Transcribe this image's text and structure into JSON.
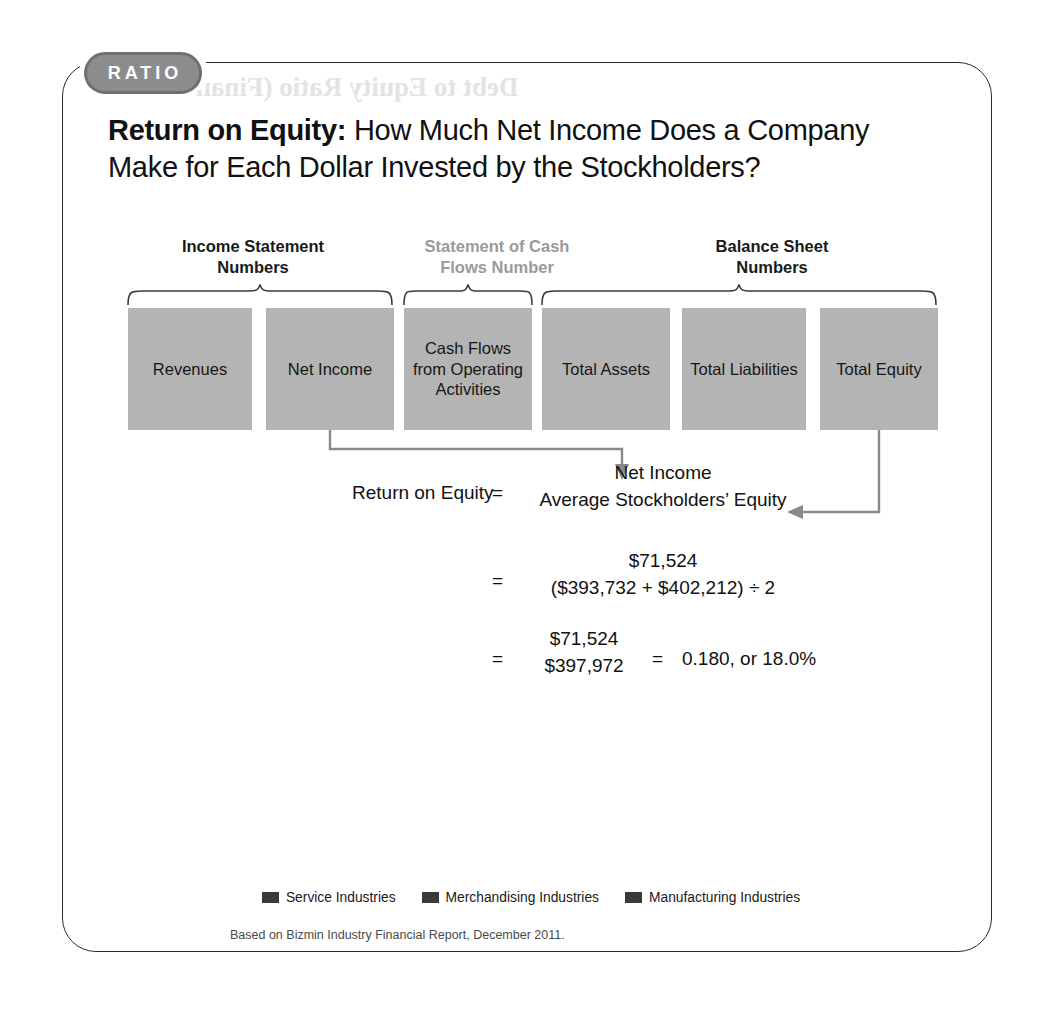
{
  "badge": {
    "label": "RATIO"
  },
  "title": {
    "bold": "Return on Equity:",
    "rest": " How Much Net Income Does a Company Make for Each Dollar Invested by the Stockholders?"
  },
  "groups": [
    {
      "label": "Income Statement\nNumbers",
      "muted": false
    },
    {
      "label": "Statement of Cash\nFlows Number",
      "muted": true
    },
    {
      "label": "Balance Sheet\nNumbers",
      "muted": false
    }
  ],
  "boxes": [
    {
      "label": "Revenues"
    },
    {
      "label": "Net Income"
    },
    {
      "label": "Cash Flows from Operating Activities"
    },
    {
      "label": "Total Assets"
    },
    {
      "label": "Total Liabilities"
    },
    {
      "label": "Total Equity"
    }
  ],
  "formula": {
    "name": "Return on Equity",
    "equals1": "=",
    "numerator1": "Net Income",
    "denominator1": "Average Stockholders’ Equity",
    "equals2": "=",
    "numerator2": "$71,524",
    "denominator2": "($393,732 + $402,212) ÷ 2",
    "equals3": "=",
    "numerator3": "$71,524",
    "denominator3": "$397,972",
    "equals4": "=",
    "result": "0.180, or 18.0%"
  },
  "chart_data": {
    "type": "bar",
    "orientation": "horizontal",
    "categories": [
      "Advertising Agencies",
      "Scheduled Air Transportation",
      "Clothing Stores",
      "Grocery Stores",
      "Industrial Machinery Manufacturing",
      "Computer and Peripheral Equipment Manufacturing"
    ],
    "values": [
      10.0,
      8.6,
      14.4,
      10.0,
      8.6,
      9.2
    ],
    "value_labels": [
      "10.0",
      "8.6",
      "14.4",
      "10.0",
      "8.6",
      "9.2"
    ],
    "group_of": [
      "Service Industries",
      "Service Industries",
      "Merchandising Industries",
      "Merchandising Industries",
      "Manufacturing Industries",
      "Manufacturing Industries"
    ],
    "ticks": [
      "0",
      "3",
      "6",
      "9",
      "12",
      "15",
      "18"
    ],
    "xlim": [
      0,
      18
    ],
    "title": "",
    "xlabel": "",
    "ylabel": "",
    "grid": true,
    "legend_position": "bottom",
    "legend": [
      "Service Industries",
      "Merchandising Industries",
      "Manufacturing Industries"
    ],
    "bar_color": "#3a3a3a",
    "track_color": "#b9b9b9"
  },
  "source": "Based on Bizmin Industry Financial Report, December 2011.",
  "ghost": {
    "text": "Debt to Equity Ratio (Finan"
  }
}
